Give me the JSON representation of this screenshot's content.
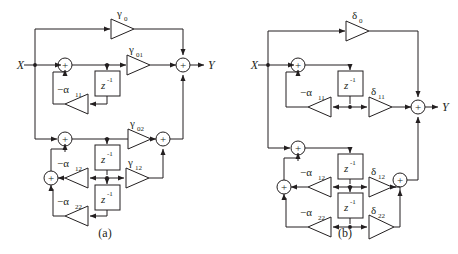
{
  "figure": {
    "type": "signal-flow-block-diagram",
    "stroke_color": "#231f20",
    "background": "#ffffff",
    "panels": [
      {
        "id": "a",
        "caption": "(a)",
        "input_label": "X",
        "output_label": "Y",
        "summers": [
          "⊕",
          "⊕",
          "⊕",
          "⊕",
          "⊕",
          "⊕"
        ],
        "delay_label": "z",
        "delay_exponent": "-1",
        "delay_count": 3,
        "gains": [
          {
            "name": "gamma0",
            "sym": "γ",
            "sub": "0"
          },
          {
            "name": "gamma01",
            "sym": "γ",
            "sub": "01"
          },
          {
            "name": "gamma02",
            "sym": "γ",
            "sub": "02"
          },
          {
            "name": "gamma12",
            "sym": "γ",
            "sub": "12"
          },
          {
            "name": "alpha11",
            "sym": "−α",
            "sub": "11"
          },
          {
            "name": "alpha12",
            "sym": "−α",
            "sub": "12"
          },
          {
            "name": "alpha22",
            "sym": "−α",
            "sub": "22"
          }
        ]
      },
      {
        "id": "b",
        "caption": "(b)",
        "input_label": "X",
        "output_label": "Y",
        "summers": [
          "⊕",
          "⊕",
          "⊕",
          "⊕",
          "⊕",
          "⊕"
        ],
        "delay_label": "z",
        "delay_exponent": "-1",
        "delay_count": 3,
        "gains": [
          {
            "name": "delta0",
            "sym": "δ",
            "sub": "0"
          },
          {
            "name": "delta11",
            "sym": "δ",
            "sub": "11"
          },
          {
            "name": "delta12",
            "sym": "δ",
            "sub": "12"
          },
          {
            "name": "delta22",
            "sym": "δ",
            "sub": "22"
          },
          {
            "name": "alpha11",
            "sym": "−α",
            "sub": "11"
          },
          {
            "name": "alpha12",
            "sym": "−α",
            "sub": "12"
          },
          {
            "name": "alpha22",
            "sym": "−α",
            "sub": "22"
          }
        ]
      }
    ]
  },
  "panel_a": {
    "caption": "(a)",
    "in": "X",
    "out": "Y",
    "g0_sym": "γ",
    "g0_sub": "0",
    "g01_sym": "γ",
    "g01_sub": "01",
    "g02_sym": "γ",
    "g02_sub": "02",
    "g12_sym": "γ",
    "g12_sub": "12",
    "a11_sym": "−α",
    "a11_sub": "11",
    "a12_sym": "−α",
    "a12_sub": "12",
    "a22_sym": "−α",
    "a22_sub": "22",
    "z": "z",
    "zexp": "-1",
    "plus1": "⊕",
    "plus2": "⊕",
    "plus3": "⊕",
    "plus4": "⊕",
    "plus5": "⊕",
    "plus6": "⊕"
  },
  "panel_b": {
    "caption": "(b)",
    "in": "X",
    "out": "Y",
    "d0_sym": "δ",
    "d0_sub": "0",
    "d11_sym": "δ",
    "d11_sub": "11",
    "d12_sym": "δ",
    "d12_sub": "12",
    "d22_sym": "δ",
    "d22_sub": "22",
    "a11_sym": "−α",
    "a11_sub": "11",
    "a12_sym": "−α",
    "a12_sub": "12",
    "a22_sym": "−α",
    "a22_sub": "22",
    "z": "z",
    "zexp": "-1",
    "plus1": "⊕",
    "plus2": "⊕",
    "plus3": "⊕",
    "plus4": "⊕",
    "plus5": "⊕",
    "plus6": "⊕"
  }
}
